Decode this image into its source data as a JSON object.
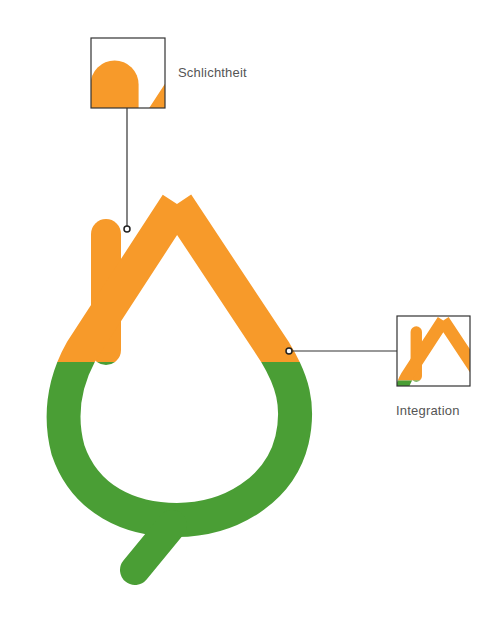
{
  "diagram": {
    "colors": {
      "orange": "#F79A2A",
      "green": "#4A9E35",
      "line": "#333333",
      "background": "#FFFFFF"
    },
    "logo": {
      "description": "Drop-shaped logo with house roof and chimney on top (orange) and ring with tail at bottom (green)"
    },
    "callouts": [
      {
        "label": "Schlichtheit",
        "detail": "chimney and roof detail"
      },
      {
        "label": "Integration",
        "detail": "roof and ring junction detail"
      }
    ]
  }
}
